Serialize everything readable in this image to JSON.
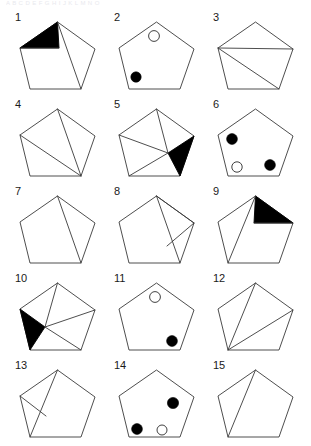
{
  "page": {
    "header_faint_text": "A B C D E F G H I J K L M N O",
    "background_color": "#ffffff",
    "line_color": "#3a3a3a",
    "fill_color": "#000000",
    "columns": 3,
    "rows": 5,
    "total_figures": 15
  },
  "figures": [
    {
      "number": "1",
      "row": 0,
      "col": 0,
      "description": "pentagon with black triangle at top-left and chord from apex to bottom-right vertex",
      "shaded_regions": 1,
      "dots": [],
      "chords": 2
    },
    {
      "number": "2",
      "row": 0,
      "col": 1,
      "description": "plain pentagon with one open circle near apex and one filled circle at lower-left",
      "shaded_regions": 0,
      "dots": [
        {
          "fill": "white",
          "position": "upper-center"
        },
        {
          "fill": "black",
          "position": "lower-left"
        }
      ],
      "chords": 0
    },
    {
      "number": "3",
      "row": 0,
      "col": 2,
      "description": "pentagon with horizontal chord joining left and right vertices plus diagonal from left vertex to bottom-right vertex",
      "shaded_regions": 0,
      "dots": [],
      "chords": 2
    },
    {
      "number": "4",
      "row": 1,
      "col": 0,
      "description": "pentagon with chords from apex to bottom-right vertex and left vertex to bottom-right vertex",
      "shaded_regions": 0,
      "dots": [],
      "chords": 2
    },
    {
      "number": "5",
      "row": 1,
      "col": 1,
      "description": "pentagon with inscribed square, right-hand triangle filled black",
      "shaded_regions": 1,
      "dots": [],
      "chords": 3
    },
    {
      "number": "6",
      "row": 1,
      "col": 2,
      "description": "plain pentagon with filled circle upper-left, open circle lower-left and filled circle lower-right",
      "shaded_regions": 0,
      "dots": [
        {
          "fill": "black",
          "position": "upper-left"
        },
        {
          "fill": "white",
          "position": "lower-left"
        },
        {
          "fill": "black",
          "position": "lower-right"
        }
      ],
      "chords": 0
    },
    {
      "number": "7",
      "row": 2,
      "col": 0,
      "description": "pentagon with single chord from apex to bottom-right vertex",
      "shaded_regions": 0,
      "dots": [],
      "chords": 1
    },
    {
      "number": "8",
      "row": 2,
      "col": 1,
      "description": "pentagon with chords apex to bottom-right vertex, apex to right vertex and right vertex to bottom-right vertex",
      "shaded_regions": 0,
      "dots": [],
      "chords": 3
    },
    {
      "number": "9",
      "row": 2,
      "col": 2,
      "description": "pentagon with black triangle at top-right and chord from apex to bottom-left vertex",
      "shaded_regions": 1,
      "dots": [],
      "chords": 2
    },
    {
      "number": "10",
      "row": 3,
      "col": 0,
      "description": "pentagon with inscribed square, left-hand triangle filled black",
      "shaded_regions": 1,
      "dots": [],
      "chords": 3
    },
    {
      "number": "11",
      "row": 3,
      "col": 1,
      "description": "plain pentagon with open circle near apex and filled circle at lower-right",
      "shaded_regions": 0,
      "dots": [
        {
          "fill": "white",
          "position": "upper-center"
        },
        {
          "fill": "black",
          "position": "lower-right"
        }
      ],
      "chords": 0
    },
    {
      "number": "12",
      "row": 3,
      "col": 2,
      "description": "pentagon with chords from apex to bottom-left vertex and right vertex to bottom-left vertex",
      "shaded_regions": 0,
      "dots": [],
      "chords": 2
    },
    {
      "number": "13",
      "row": 4,
      "col": 0,
      "description": "pentagon with chords apex to bottom-left vertex and left vertex to bottom-left vertex",
      "shaded_regions": 0,
      "dots": [],
      "chords": 3
    },
    {
      "number": "14",
      "row": 4,
      "col": 1,
      "description": "plain pentagon with filled circle upper-right, filled circle lower-left and open circle bottom-center",
      "shaded_regions": 0,
      "dots": [
        {
          "fill": "black",
          "position": "upper-right"
        },
        {
          "fill": "black",
          "position": "lower-left"
        },
        {
          "fill": "white",
          "position": "bottom-center"
        }
      ],
      "chords": 0
    },
    {
      "number": "15",
      "row": 4,
      "col": 2,
      "description": "pentagon with single chord from apex to bottom-left vertex",
      "shaded_regions": 0,
      "dots": [],
      "chords": 1
    }
  ]
}
